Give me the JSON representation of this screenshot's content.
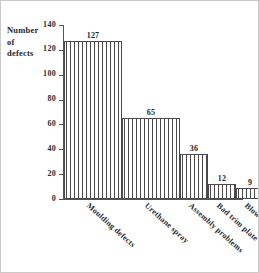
{
  "chart_data": {
    "type": "bar",
    "title": "",
    "subtitle": "",
    "xlabel": "",
    "ylabel": "Number of defects",
    "ylabel_lines": [
      "Number",
      "of",
      "defects"
    ],
    "categories": [
      "Moulding defects",
      "Urethane spray",
      "Assembly problems",
      "Bad trim plate",
      "Blow pressure wrong",
      "Other"
    ],
    "values": [
      127,
      65,
      36,
      12,
      9,
      11
    ],
    "value_labels": [
      "127",
      "65",
      "36",
      "12",
      "9",
      "11"
    ],
    "ylim": [
      0,
      140
    ],
    "yticks": [
      0,
      20,
      40,
      60,
      80,
      100,
      120,
      140
    ],
    "ytick_labels": [
      "0",
      "20",
      "40",
      "60",
      "80",
      "100",
      "120",
      "140"
    ],
    "grid": false,
    "legend": false,
    "legend_position": "none",
    "bar_style": "vertical-hatch",
    "bars_adjacent": true,
    "colors": {
      "bar_edge": "#4a4a4a",
      "bar_fill": "#ffffff",
      "hatch": "#4a4a4a",
      "axis": "#555555",
      "text": "#262626",
      "background": "#ffffff"
    }
  }
}
